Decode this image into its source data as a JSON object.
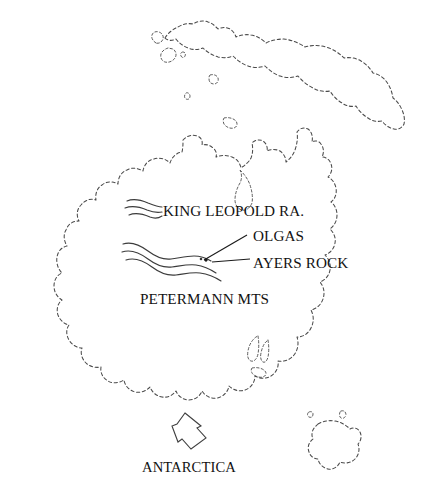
{
  "map": {
    "region": "Australia",
    "background_color": "#ffffff",
    "line_color": "#4a4a4a",
    "label_color": "#121212",
    "labels": {
      "king_leopold": "KING LEOPOLD RA.",
      "olgas": "OLGAS",
      "ayers_rock": "AYERS ROCK",
      "petermann": "PETERMANN MTS",
      "antarctica": "ANTARCTICA"
    },
    "features": {
      "mountain_ranges": [
        {
          "name": "KING LEOPOLD RA.",
          "symbol": "wavy-lines",
          "line_count": 3
        },
        {
          "name": "PETERMANN MTS",
          "symbol": "wavy-lines",
          "line_count": 3
        }
      ],
      "point_markers": [
        {
          "name": "AYERS ROCK",
          "symbol": "dot"
        },
        {
          "name": "OLGAS",
          "symbol": "dot"
        }
      ],
      "landmasses": [
        "Australia mainland",
        "New Guinea",
        "Tasmania"
      ]
    },
    "direction_indicator": {
      "symbol": "arrow",
      "points_to": "ANTARCTICA"
    }
  }
}
